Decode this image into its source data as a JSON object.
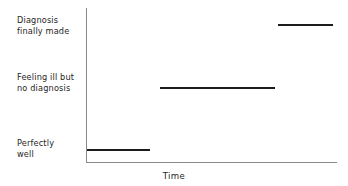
{
  "chart_data": {
    "type": "line",
    "subtype": "step",
    "title": "",
    "xlabel": "Time",
    "ylabel": "",
    "grid": false,
    "legend": null,
    "axis_color": "#8a8a8a",
    "series_color": "#1c1c1c",
    "background": "#ffffff",
    "categories": [
      "Perfectly well",
      "Feeling ill but no diagnosis",
      "Diagnosis finally made"
    ],
    "ytick_labels": [
      {
        "line1": "Perfectly",
        "line2": "well"
      },
      {
        "line1": "Feeling ill but",
        "line2": "no diagnosis"
      },
      {
        "line1": "Diagnosis",
        "line2": "finally made"
      }
    ],
    "values": [
      1,
      2,
      3
    ],
    "steps": [
      {
        "label": "Perfectly well",
        "level": 1,
        "x_start": 0,
        "x_end": 25
      },
      {
        "label": "Feeling ill but no diagnosis",
        "level": 2,
        "x_start": 29,
        "x_end": 75
      },
      {
        "label": "Diagnosis finally made",
        "level": 3,
        "x_start": 76,
        "x_end": 98
      }
    ],
    "xlim": [
      0,
      100
    ],
    "ylim": [
      0,
      3.5
    ],
    "annotations": []
  },
  "axis": {
    "x_title": "Time"
  },
  "labels": {
    "diagnosis": {
      "line1": "Diagnosis",
      "line2": "finally made"
    },
    "ill": {
      "line1": "Feeling ill but",
      "line2": "no diagnosis"
    },
    "well": {
      "line1": "Perfectly",
      "line2": "well"
    }
  }
}
